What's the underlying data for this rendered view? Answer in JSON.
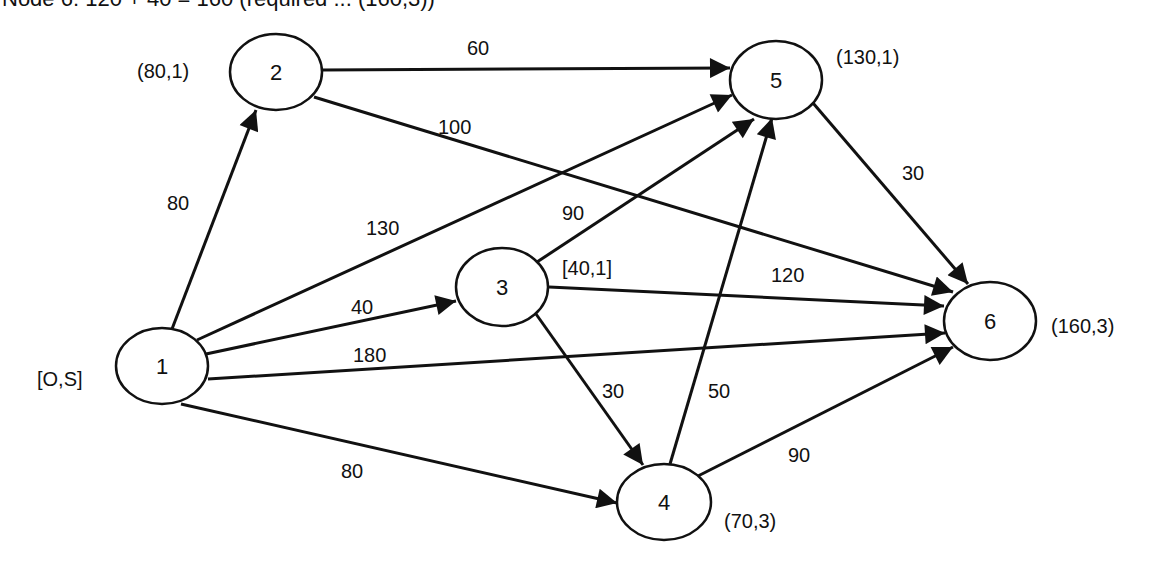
{
  "header": {
    "text": "Node 6: 120 + 40 = 160 (required ... (160,3))"
  },
  "graph": {
    "nodes": [
      {
        "id": "1",
        "label": "1",
        "annotation": "[O,S]"
      },
      {
        "id": "2",
        "label": "2",
        "annotation": "(80,1)"
      },
      {
        "id": "3",
        "label": "3",
        "annotation": "[40,1]"
      },
      {
        "id": "4",
        "label": "4",
        "annotation": "(70,3)"
      },
      {
        "id": "5",
        "label": "5",
        "annotation": "(130,1)"
      },
      {
        "id": "6",
        "label": "6",
        "annotation": "(160,3)"
      }
    ],
    "edges": [
      {
        "from": "1",
        "to": "2",
        "weight": "80"
      },
      {
        "from": "1",
        "to": "5",
        "weight": "130"
      },
      {
        "from": "1",
        "to": "3",
        "weight": "40"
      },
      {
        "from": "1",
        "to": "6",
        "weight": "180"
      },
      {
        "from": "1",
        "to": "4",
        "weight": "80"
      },
      {
        "from": "2",
        "to": "5",
        "weight": "60"
      },
      {
        "from": "2",
        "to": "6",
        "weight": "100"
      },
      {
        "from": "3",
        "to": "5",
        "weight": "90"
      },
      {
        "from": "3",
        "to": "6",
        "weight": "120"
      },
      {
        "from": "3",
        "to": "4",
        "weight": "30"
      },
      {
        "from": "4",
        "to": "5",
        "weight": "50"
      },
      {
        "from": "4",
        "to": "6",
        "weight": "90"
      },
      {
        "from": "5",
        "to": "6",
        "weight": "30"
      }
    ]
  }
}
